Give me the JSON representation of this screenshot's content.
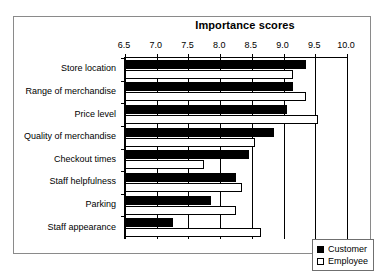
{
  "chart_data": {
    "type": "bar",
    "orientation": "horizontal",
    "title": "Importance scores",
    "xlabel": "",
    "ylabel": "",
    "xlim": [
      6.5,
      10.0
    ],
    "xticks": [
      "6.5",
      "7.0",
      "7.5",
      "8.0",
      "8.5",
      "9.0",
      "9.5",
      "10.0"
    ],
    "xtick_values": [
      6.5,
      7.0,
      7.5,
      8.0,
      8.5,
      9.0,
      9.5,
      10.0
    ],
    "grid": true,
    "legend_position": "lower right",
    "categories": [
      "Store location",
      "Range of merchandise",
      "Price level",
      "Quality of merchandise",
      "Checkout times",
      "Staff helpfulness",
      "Parking",
      "Staff appearance"
    ],
    "series": [
      {
        "name": "Customer",
        "color": "#000000",
        "values": [
          9.35,
          9.15,
          9.05,
          8.85,
          8.45,
          8.25,
          7.85,
          7.25
        ]
      },
      {
        "name": "Employee",
        "color": "#ffffff",
        "values": [
          9.15,
          9.35,
          9.55,
          8.55,
          7.75,
          8.35,
          8.25,
          8.65
        ]
      }
    ]
  },
  "legend": {
    "entries": [
      {
        "label": "Customer",
        "swatch": "filled"
      },
      {
        "label": "Employee",
        "swatch": "hollow"
      }
    ]
  }
}
